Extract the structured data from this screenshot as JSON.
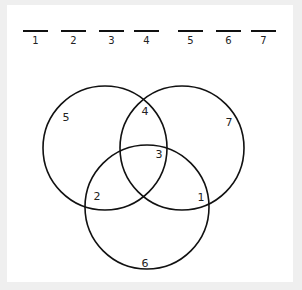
{
  "blanks": [
    {
      "label": "1",
      "x": 23
    },
    {
      "label": "2",
      "x": 61
    },
    {
      "label": "3",
      "x": 99
    },
    {
      "label": "4",
      "x": 134
    },
    {
      "label": "5",
      "x": 178
    },
    {
      "label": "6",
      "x": 216
    },
    {
      "label": "7",
      "x": 251
    }
  ],
  "venn": {
    "circles": [
      {
        "name": "left",
        "cx": 105,
        "cy": 148,
        "r": 62
      },
      {
        "name": "right",
        "cx": 182,
        "cy": 148,
        "r": 62
      },
      {
        "name": "bottom",
        "cx": 147,
        "cy": 207,
        "r": 62
      }
    ],
    "regions": [
      {
        "label": "5",
        "x": 66,
        "y": 121
      },
      {
        "label": "4",
        "x": 145,
        "y": 115
      },
      {
        "label": "7",
        "x": 229,
        "y": 126
      },
      {
        "label": "3",
        "x": 159,
        "y": 158
      },
      {
        "label": "2",
        "x": 97,
        "y": 200
      },
      {
        "label": "1",
        "x": 201,
        "y": 201
      },
      {
        "label": "6",
        "x": 145,
        "y": 267
      }
    ],
    "stroke_color": "#111111"
  }
}
